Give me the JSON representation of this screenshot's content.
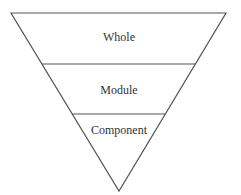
{
  "diagram": {
    "type": "inverted-pyramid",
    "stroke_color": "#555555",
    "text_color": "#333333",
    "levels": [
      {
        "label": "Whole"
      },
      {
        "label": "Module"
      },
      {
        "label": "Component"
      }
    ]
  }
}
